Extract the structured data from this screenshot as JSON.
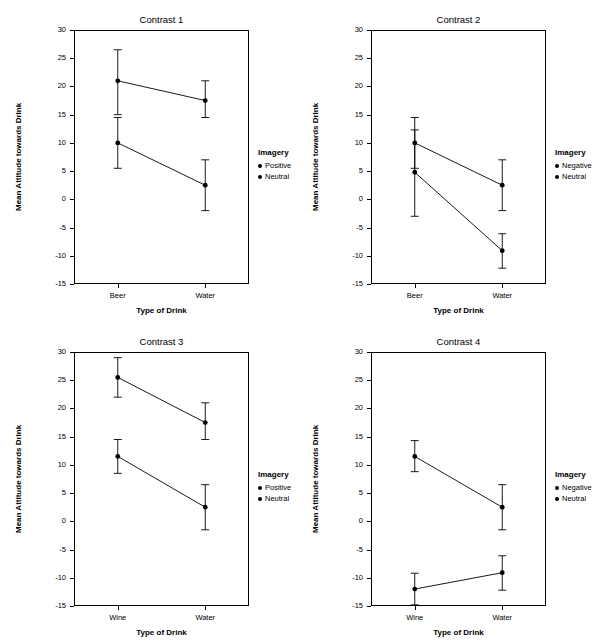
{
  "figure": {
    "width": 597,
    "height": 644,
    "panels": [
      {
        "id": "contrast-1",
        "title": "Contrast 1",
        "ylabel": "Mean Attitude towards Drink",
        "xlabel": "Type of Drink",
        "categories": [
          "Beer",
          "Water"
        ],
        "yticks": [
          -15,
          -10,
          -5,
          0,
          5,
          10,
          15,
          20,
          25,
          30
        ],
        "ylim": [
          -15,
          30
        ],
        "legend": {
          "title": "Imagery",
          "entries": [
            "Positive",
            "Neutral"
          ]
        },
        "series": [
          {
            "name": "Positive",
            "values": [
              21.0,
              17.5
            ],
            "err_low": [
              15.0,
              14.5
            ],
            "err_high": [
              26.5,
              21.0
            ]
          },
          {
            "name": "Neutral",
            "values": [
              10.0,
              2.5
            ],
            "err_low": [
              5.5,
              -2.0
            ],
            "err_high": [
              14.5,
              7.0
            ]
          }
        ]
      },
      {
        "id": "contrast-2",
        "title": "Contrast 2",
        "ylabel": "Mean Attitude towards Drink",
        "xlabel": "Type of Drink",
        "categories": [
          "Beer",
          "Water"
        ],
        "yticks": [
          -15,
          -10,
          -5,
          0,
          5,
          10,
          15,
          20,
          25,
          30
        ],
        "ylim": [
          -15,
          30
        ],
        "legend": {
          "title": "Imagery",
          "entries": [
            "Negative",
            "Neutral"
          ]
        },
        "series": [
          {
            "name": "Negative",
            "values": [
              4.8,
              -9.1
            ],
            "err_low": [
              -3.0,
              -12.2
            ],
            "err_high": [
              12.3,
              -6.1
            ]
          },
          {
            "name": "Neutral",
            "values": [
              10.0,
              2.5
            ],
            "err_low": [
              5.5,
              -2.0
            ],
            "err_high": [
              14.5,
              7.0
            ]
          }
        ]
      },
      {
        "id": "contrast-3",
        "title": "Contrast 3",
        "ylabel": "Mean Attitude towards Drink",
        "xlabel": "Type of Drink",
        "categories": [
          "Wine",
          "Water"
        ],
        "yticks": [
          -15,
          -10,
          -5,
          0,
          5,
          10,
          15,
          20,
          25,
          30
        ],
        "ylim": [
          -15,
          30
        ],
        "legend": {
          "title": "Imagery",
          "entries": [
            "Positive",
            "Neutral"
          ]
        },
        "series": [
          {
            "name": "Positive",
            "values": [
              25.5,
              17.5
            ],
            "err_low": [
              22.0,
              14.5
            ],
            "err_high": [
              29.0,
              21.0
            ]
          },
          {
            "name": "Neutral",
            "values": [
              11.5,
              2.5
            ],
            "err_low": [
              8.5,
              -1.5
            ],
            "err_high": [
              14.5,
              6.5
            ]
          }
        ]
      },
      {
        "id": "contrast-4",
        "title": "Contrast 4",
        "ylabel": "Mean Attitude towards Drink",
        "xlabel": "Type of Drink",
        "categories": [
          "Wine",
          "Water"
        ],
        "yticks": [
          -15,
          -10,
          -5,
          0,
          5,
          10,
          15,
          20,
          25,
          30
        ],
        "ylim": [
          -15,
          30
        ],
        "legend": {
          "title": "Imagery",
          "entries": [
            "Negative",
            "Neutral"
          ]
        },
        "series": [
          {
            "name": "Negative",
            "values": [
              -12.0,
              -9.1
            ],
            "err_low": [
              -14.8,
              -12.2
            ],
            "err_high": [
              -9.2,
              -6.1
            ]
          },
          {
            "name": "Neutral",
            "values": [
              11.5,
              2.5
            ],
            "err_low": [
              8.8,
              -1.5
            ],
            "err_high": [
              14.3,
              6.5
            ]
          }
        ]
      }
    ]
  },
  "chart_data": {
    "type": "line",
    "title": "",
    "panels": [
      {
        "title": "Contrast 1",
        "xlabel": "Type of Drink",
        "ylabel": "Mean Attitude towards Drink",
        "categories": [
          "Beer",
          "Water"
        ],
        "ylim": [
          -15,
          30
        ],
        "yticks": [
          -15,
          -10,
          -5,
          0,
          5,
          10,
          15,
          20,
          25,
          30
        ],
        "grid": false,
        "legend_position": "right",
        "legend_title": "Imagery",
        "series": [
          {
            "name": "Positive",
            "values": [
              21.0,
              17.5
            ],
            "ci_low": [
              15.0,
              14.5
            ],
            "ci_high": [
              26.5,
              21.0
            ]
          },
          {
            "name": "Neutral",
            "values": [
              10.0,
              2.5
            ],
            "ci_low": [
              5.5,
              -2.0
            ],
            "ci_high": [
              14.5,
              7.0
            ]
          }
        ]
      },
      {
        "title": "Contrast 2",
        "xlabel": "Type of Drink",
        "ylabel": "Mean Attitude towards Drink",
        "categories": [
          "Beer",
          "Water"
        ],
        "ylim": [
          -15,
          30
        ],
        "yticks": [
          -15,
          -10,
          -5,
          0,
          5,
          10,
          15,
          20,
          25,
          30
        ],
        "grid": false,
        "legend_position": "right",
        "legend_title": "Imagery",
        "series": [
          {
            "name": "Negative",
            "values": [
              4.8,
              -9.1
            ],
            "ci_low": [
              -3.0,
              -12.2
            ],
            "ci_high": [
              12.3,
              -6.1
            ]
          },
          {
            "name": "Neutral",
            "values": [
              10.0,
              2.5
            ],
            "ci_low": [
              5.5,
              -2.0
            ],
            "ci_high": [
              14.5,
              7.0
            ]
          }
        ]
      },
      {
        "title": "Contrast 3",
        "xlabel": "Type of Drink",
        "ylabel": "Mean Attitude towards Drink",
        "categories": [
          "Wine",
          "Water"
        ],
        "ylim": [
          -15,
          30
        ],
        "yticks": [
          -15,
          -10,
          -5,
          0,
          5,
          10,
          15,
          20,
          25,
          30
        ],
        "grid": false,
        "legend_position": "right",
        "legend_title": "Imagery",
        "series": [
          {
            "name": "Positive",
            "values": [
              25.5,
              17.5
            ],
            "ci_low": [
              22.0,
              14.5
            ],
            "ci_high": [
              29.0,
              21.0
            ]
          },
          {
            "name": "Neutral",
            "values": [
              11.5,
              2.5
            ],
            "ci_low": [
              8.5,
              -1.5
            ],
            "ci_high": [
              14.5,
              6.5
            ]
          }
        ]
      },
      {
        "title": "Contrast 4",
        "xlabel": "Type of Drink",
        "ylabel": "Mean Attitude towards Drink",
        "categories": [
          "Wine",
          "Water"
        ],
        "ylim": [
          -15,
          30
        ],
        "yticks": [
          -15,
          -10,
          -5,
          0,
          5,
          10,
          15,
          20,
          25,
          30
        ],
        "grid": false,
        "legend_position": "right",
        "legend_title": "Imagery",
        "series": [
          {
            "name": "Negative",
            "values": [
              -12.0,
              -9.1
            ],
            "ci_low": [
              -14.8,
              -12.2
            ],
            "ci_high": [
              -9.2,
              -6.1
            ]
          },
          {
            "name": "Neutral",
            "values": [
              11.5,
              2.5
            ],
            "ci_low": [
              8.8,
              -1.5
            ],
            "ci_high": [
              14.3,
              6.5
            ]
          }
        ]
      }
    ]
  }
}
